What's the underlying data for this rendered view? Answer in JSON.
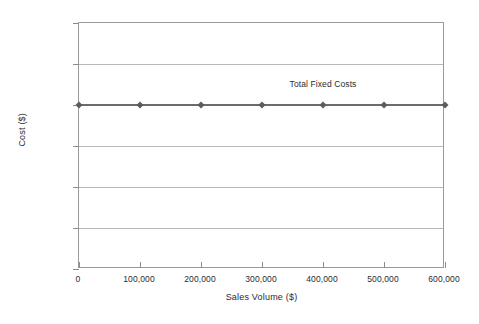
{
  "chart_data": {
    "type": "line",
    "title": "",
    "xlabel": "Sales Volume ($)",
    "ylabel": "Cost ($)",
    "xlim": [
      0,
      600000
    ],
    "ylim": [
      0,
      300000
    ],
    "grid": true,
    "legend_position": "none",
    "x": [
      0,
      100000,
      200000,
      300000,
      400000,
      500000,
      600000
    ],
    "xtick_labels": [
      "0",
      "100,000",
      "200,000",
      "300,000",
      "400,000",
      "500,000",
      "600,000"
    ],
    "ytick_values": [
      0,
      50000,
      100000,
      150000,
      200000,
      250000,
      300000
    ],
    "ytick_labels": [
      "0",
      "50,000",
      "100,000",
      "150,000",
      "200,000",
      "250,000",
      "300,000"
    ],
    "series": [
      {
        "name": "Total Fixed Costs",
        "values": [
          200000,
          200000,
          200000,
          200000,
          200000,
          200000,
          200000
        ],
        "color": "#6b6b6b",
        "marker": "diamond",
        "marker_color": "#5c5c5c"
      }
    ],
    "annotations": [
      {
        "text": "Total Fixed Costs",
        "x": 400000,
        "y": 232000
      }
    ]
  },
  "colors": {
    "series": "#6b6b6b",
    "marker": "#5c5c5c",
    "grid": "#b8b8b8",
    "axis": "#9a9a9a",
    "text": "#2b2b2b",
    "background": "#ffffff"
  }
}
